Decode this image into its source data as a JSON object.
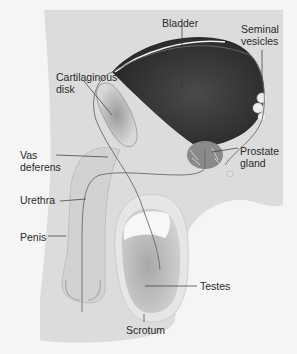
{
  "diagram": {
    "type": "anatomical",
    "colors": {
      "background": "#f5f5f5",
      "body_fill": "#dcdcdc",
      "bladder_fill": "#3a3a3a",
      "testis_fill": "#bdbdbd",
      "scrotum_wall": "#e6e6e6",
      "duct_line": "#6a6a6a",
      "label_text": "#2a2a2a"
    },
    "labels": {
      "bladder": "Bladder",
      "seminal_vesicles": "Seminal\nvesicles",
      "cartilaginous_disk": "Cartilaginous\ndisk",
      "vas_deferens": "Vas\ndeferens",
      "prostate_gland": "Prostate\ngland",
      "urethra": "Urethra",
      "penis": "Penis",
      "testes": "Testes",
      "scrotum": "Scrotum"
    }
  }
}
